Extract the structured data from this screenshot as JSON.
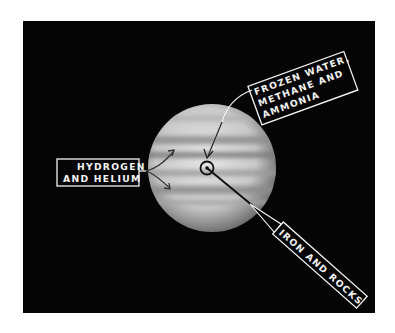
{
  "figure": {
    "labels": {
      "outer": [
        "HYDROGEN",
        "AND HELIUM"
      ],
      "mantle": [
        "FROZEN WATER,",
        "METHANE AND",
        "AMMONIA"
      ],
      "core": [
        "IRON AND ROCKS"
      ]
    }
  },
  "colors": {
    "background": "#ffffff",
    "panel": "#050505",
    "label_text": "#f4f4f4",
    "label_border": "#f4f4f4",
    "planet_light": "#d8d8d8",
    "planet_band": "#8a8a8a"
  }
}
